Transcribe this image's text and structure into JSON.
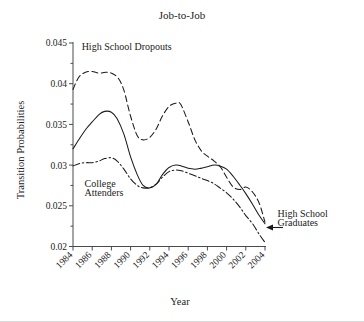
{
  "chart_data": {
    "type": "line",
    "title": "Job-to-Job",
    "xlabel": "Year",
    "ylabel": "Transition Probabilities",
    "grid": false,
    "legend_position": "inline-annotations",
    "xlim": [
      1984,
      2004
    ],
    "ylim": [
      0.02,
      0.045
    ],
    "yticks": [
      "0.045",
      "0.04",
      "0.035",
      "0.03",
      "0.025",
      "0.02"
    ],
    "ytick_values": [
      0.045,
      0.04,
      0.035,
      0.03,
      0.025,
      0.02
    ],
    "categories": [
      1984,
      1986,
      1988,
      1990,
      1992,
      1994,
      1996,
      1998,
      2000,
      2002,
      2004
    ],
    "xtick_labels": [
      "1984",
      "1986",
      "1988",
      "1990",
      "1992",
      "1994",
      "1996",
      "1998",
      "2000",
      "2002",
      "2004"
    ],
    "series": [
      {
        "name": "High School Dropouts",
        "style": "dashed",
        "x": [
          1984,
          1984.6,
          1985.3,
          1986,
          1986.7,
          1987.4,
          1988,
          1988.7,
          1989.3,
          1990,
          1990.7,
          1991.3,
          1992,
          1992.7,
          1993.3,
          1994,
          1994.7,
          1995.2,
          1996,
          1996.7,
          1997.4,
          1998,
          1998.7,
          1999.4,
          2000,
          2000.7,
          2001.4,
          2002,
          2002.7,
          2003.4,
          2004
        ],
        "values": [
          0.0393,
          0.0408,
          0.0414,
          0.0415,
          0.0413,
          0.0414,
          0.0413,
          0.0407,
          0.0392,
          0.036,
          0.0336,
          0.0331,
          0.0334,
          0.0345,
          0.036,
          0.0372,
          0.0376,
          0.0375,
          0.0353,
          0.0331,
          0.0317,
          0.0311,
          0.0305,
          0.0297,
          0.0285,
          0.0273,
          0.027,
          0.0273,
          0.0267,
          0.0253,
          0.023
        ]
      },
      {
        "name": "High School Graduates",
        "style": "solid",
        "x": [
          1984,
          1984.7,
          1985.4,
          1986,
          1986.7,
          1987.3,
          1988,
          1988.6,
          1989.3,
          1990,
          1990.7,
          1991.3,
          1992,
          1992.7,
          1993.3,
          1994,
          1994.7,
          1995.3,
          1996,
          1996.7,
          1997.3,
          1998,
          1998.7,
          1999.3,
          2000,
          2000.7,
          2001.4,
          2002,
          2002.7,
          2003.4,
          2004
        ],
        "values": [
          0.032,
          0.0333,
          0.0345,
          0.0353,
          0.0362,
          0.0366,
          0.0365,
          0.0357,
          0.0338,
          0.031,
          0.0288,
          0.0275,
          0.0272,
          0.0277,
          0.0288,
          0.0297,
          0.03,
          0.0299,
          0.0296,
          0.0295,
          0.0296,
          0.0298,
          0.03,
          0.0299,
          0.0295,
          0.0286,
          0.0275,
          0.0265,
          0.0252,
          0.0238,
          0.0228
        ]
      },
      {
        "name": "College Attenders",
        "style": "dash-dot",
        "x": [
          1984,
          1984.7,
          1985.4,
          1986,
          1986.7,
          1987.3,
          1988,
          1988.6,
          1989.3,
          1990,
          1990.7,
          1991.3,
          1992,
          1992.7,
          1993.3,
          1994,
          1994.7,
          1995.3,
          1996,
          1996.7,
          1997.3,
          1998,
          1998.7,
          1999.3,
          2000,
          2000.7,
          2001.4,
          2002,
          2002.7,
          2003.4,
          2004
        ],
        "values": [
          0.0299,
          0.0302,
          0.0303,
          0.0303,
          0.0305,
          0.0308,
          0.0309,
          0.0305,
          0.0295,
          0.0283,
          0.0275,
          0.0272,
          0.0272,
          0.0277,
          0.0285,
          0.0292,
          0.0294,
          0.0293,
          0.029,
          0.0287,
          0.0284,
          0.0281,
          0.0277,
          0.0272,
          0.0266,
          0.0258,
          0.0248,
          0.0238,
          0.0228,
          0.0215,
          0.0205
        ]
      }
    ],
    "annotations": [
      {
        "text": "High School Dropouts",
        "x": 1984.9,
        "y": 0.0441
      },
      {
        "text": "College",
        "x": 1985.2,
        "y": 0.0273
      },
      {
        "text": "Attenders",
        "x": 1985.2,
        "y": 0.0262
      },
      {
        "text": "High School",
        "x": 2005.3,
        "y": 0.0236
      },
      {
        "text": "Graduates",
        "x": 2005.3,
        "y": 0.0225
      }
    ],
    "colors": {
      "line": "#1a1a1a",
      "axis": "#4a4a4a",
      "background": "#ffffff"
    }
  }
}
